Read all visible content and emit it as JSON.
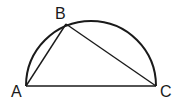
{
  "diagram": {
    "type": "geometry",
    "points": {
      "A": {
        "label": "A",
        "x": 26,
        "y": 86
      },
      "B": {
        "label": "B",
        "x": 66,
        "y": 24
      },
      "C": {
        "label": "C",
        "x": 156,
        "y": 86
      }
    },
    "segments": [
      "AB",
      "BC",
      "AC"
    ],
    "arc": {
      "type": "semicircle",
      "diameter": "AC"
    },
    "colors": {
      "stroke": "#1a1a1a",
      "background": "#ffffff"
    }
  }
}
